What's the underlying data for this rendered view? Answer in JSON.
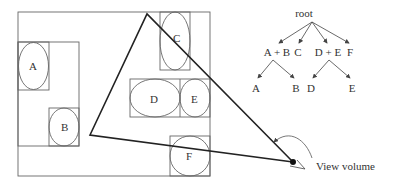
{
  "diagram": {
    "scene": {
      "objects": [
        {
          "id": "A",
          "label": "A"
        },
        {
          "id": "B",
          "label": "B"
        },
        {
          "id": "C",
          "label": "C"
        },
        {
          "id": "D",
          "label": "D"
        },
        {
          "id": "E",
          "label": "E"
        },
        {
          "id": "F",
          "label": "F"
        }
      ],
      "view_volume_label": "View volume"
    },
    "tree": {
      "root": "root",
      "level1": [
        "A + B",
        "C",
        "D + E",
        "F"
      ],
      "level2": [
        "A",
        "B",
        "D",
        "E"
      ]
    },
    "colors": {
      "lines": "#555555",
      "frustum": "#222222",
      "text": "#333333"
    }
  }
}
